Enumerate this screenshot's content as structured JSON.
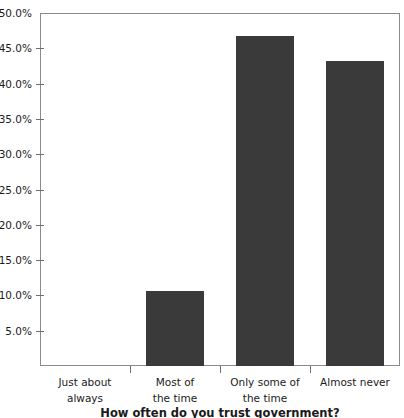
{
  "chart_data": {
    "type": "bar",
    "title": "",
    "xlabel": "How often do you trust government?",
    "ylabel": "",
    "categories": [
      "Just about always",
      "Most of the time",
      "Only some of the time",
      "Almost never"
    ],
    "category_lines": [
      [
        "Just about",
        "always"
      ],
      [
        "Most of",
        "the time"
      ],
      [
        "Only some of",
        "the time"
      ],
      [
        "Almost never"
      ]
    ],
    "values": [
      0.0,
      10.6,
      46.7,
      43.2
    ],
    "value_labels": [
      "0.0%",
      "10.6%",
      "46.7%",
      "43.2%"
    ],
    "ylim": [
      0,
      50
    ],
    "ytick_labels": [
      "50.0%",
      "45.0%",
      "40.0%",
      "35.0%",
      "30.0%",
      "25.0%",
      "20.0%",
      "15.0%",
      "10.0%",
      "5.0%"
    ],
    "ytick_values": [
      50,
      45,
      40,
      35,
      30,
      25,
      20,
      15,
      10,
      5
    ],
    "grid": false,
    "legend": false,
    "legend_position": "none",
    "bar_color": "#3a3a3a",
    "background_color": "#ffffff",
    "axis_color": "#8b8b8b",
    "text_color": "#1a1a1a"
  }
}
